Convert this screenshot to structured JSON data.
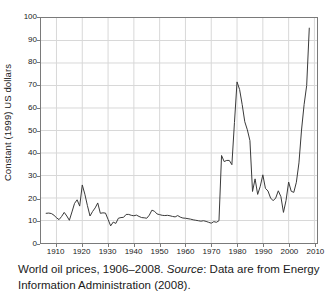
{
  "chart_data": {
    "type": "line",
    "title": "",
    "subtitle": "",
    "xlabel": "",
    "ylabel": "Constant (1999) US dollars",
    "xlim": [
      1904,
      2011
    ],
    "ylim": [
      0,
      100
    ],
    "grid": true,
    "legend_position": "none",
    "line_color": "#3a3a3a",
    "grid_color": "#d8d8d8",
    "axis_color": "#7a7a7a",
    "xticks": [
      1910,
      1920,
      1930,
      1940,
      1950,
      1960,
      1970,
      1980,
      1990,
      2000,
      2010
    ],
    "yticks": [
      0,
      10,
      20,
      30,
      40,
      50,
      60,
      70,
      80,
      90,
      100
    ],
    "series": [
      {
        "name": "World oil price (constant 1999 US dollars per barrel)",
        "x": [
          1906,
          1907,
          1908,
          1909,
          1910,
          1911,
          1912,
          1913,
          1914,
          1915,
          1916,
          1917,
          1918,
          1919,
          1920,
          1921,
          1922,
          1923,
          1924,
          1925,
          1926,
          1927,
          1928,
          1929,
          1930,
          1931,
          1932,
          1933,
          1934,
          1935,
          1936,
          1937,
          1938,
          1939,
          1940,
          1941,
          1942,
          1943,
          1944,
          1945,
          1946,
          1947,
          1948,
          1949,
          1950,
          1951,
          1952,
          1953,
          1954,
          1955,
          1956,
          1957,
          1958,
          1959,
          1960,
          1961,
          1962,
          1963,
          1964,
          1965,
          1966,
          1967,
          1968,
          1969,
          1970,
          1971,
          1972,
          1973,
          1974,
          1975,
          1976,
          1977,
          1978,
          1979,
          1980,
          1981,
          1982,
          1983,
          1984,
          1985,
          1986,
          1987,
          1988,
          1989,
          1990,
          1991,
          1992,
          1993,
          1994,
          1995,
          1996,
          1997,
          1998,
          1999,
          2000,
          2001,
          2002,
          2003,
          2004,
          2005,
          2006,
          2007,
          2008
        ],
        "values": [
          13.2,
          13.3,
          13.1,
          12.4,
          11.2,
          10.4,
          11.8,
          13.6,
          12.0,
          10.1,
          13.8,
          17.6,
          19.2,
          16.4,
          25.8,
          21.7,
          16.6,
          12.0,
          14.0,
          15.6,
          17.8,
          13.2,
          13.4,
          13.3,
          10.5,
          7.6,
          9.3,
          8.7,
          11.0,
          11.3,
          11.4,
          12.7,
          12.7,
          12.3,
          12.1,
          12.4,
          11.8,
          11.3,
          11.2,
          11.0,
          12.4,
          14.6,
          14.1,
          12.9,
          12.6,
          12.3,
          12.2,
          12.3,
          12.1,
          11.8,
          11.6,
          12.2,
          11.5,
          11.1,
          11.0,
          10.8,
          10.6,
          10.3,
          10.1,
          9.9,
          9.7,
          9.9,
          9.6,
          9.2,
          8.8,
          9.5,
          9.2,
          9.9,
          38.9,
          36.2,
          36.7,
          36.7,
          34.8,
          53.6,
          71.6,
          68.2,
          61.5,
          53.9,
          50.3,
          45.5,
          22.9,
          28.5,
          21.6,
          25.2,
          30.3,
          24.3,
          23.1,
          20.0,
          18.8,
          20.0,
          23.2,
          20.6,
          13.6,
          18.9,
          27.1,
          23.0,
          22.5,
          27.0,
          35.6,
          50.2,
          61.5,
          70.0,
          95.5
        ],
        "units": "US dollars per barrel",
        "n_points": 103,
        "min_value": 7.6,
        "min_year": 1931,
        "max_value": 95.5,
        "max_year": 2008,
        "notable": [
          {
            "year": 1920,
            "value": 25.8,
            "note": "post-WWI peak"
          },
          {
            "year": 1931,
            "value": 7.6,
            "note": "Depression low"
          },
          {
            "year": 1974,
            "value": 38.9,
            "note": "first oil shock"
          },
          {
            "year": 1980,
            "value": 71.6,
            "note": "second oil shock peak"
          },
          {
            "year": 1998,
            "value": 13.6,
            "note": "Asian crisis low"
          },
          {
            "year": 2008,
            "value": 95.5,
            "note": "record high"
          }
        ]
      }
    ]
  },
  "axis": {
    "ylabel": "Constant (1999) US dollars",
    "ytick_labels": [
      "0",
      "10",
      "20",
      "30",
      "40",
      "50",
      "60",
      "70",
      "80",
      "90",
      "100"
    ],
    "xtick_labels": [
      "1910",
      "1920",
      "1930",
      "1940",
      "1950",
      "1960",
      "1970",
      "1980",
      "1990",
      "2000",
      "2010"
    ]
  },
  "caption": {
    "text_before": "World oil prices, 1906–2008. ",
    "source_word": "Source",
    "text_after": ": Data are from Energy Information Administration (2008)."
  }
}
